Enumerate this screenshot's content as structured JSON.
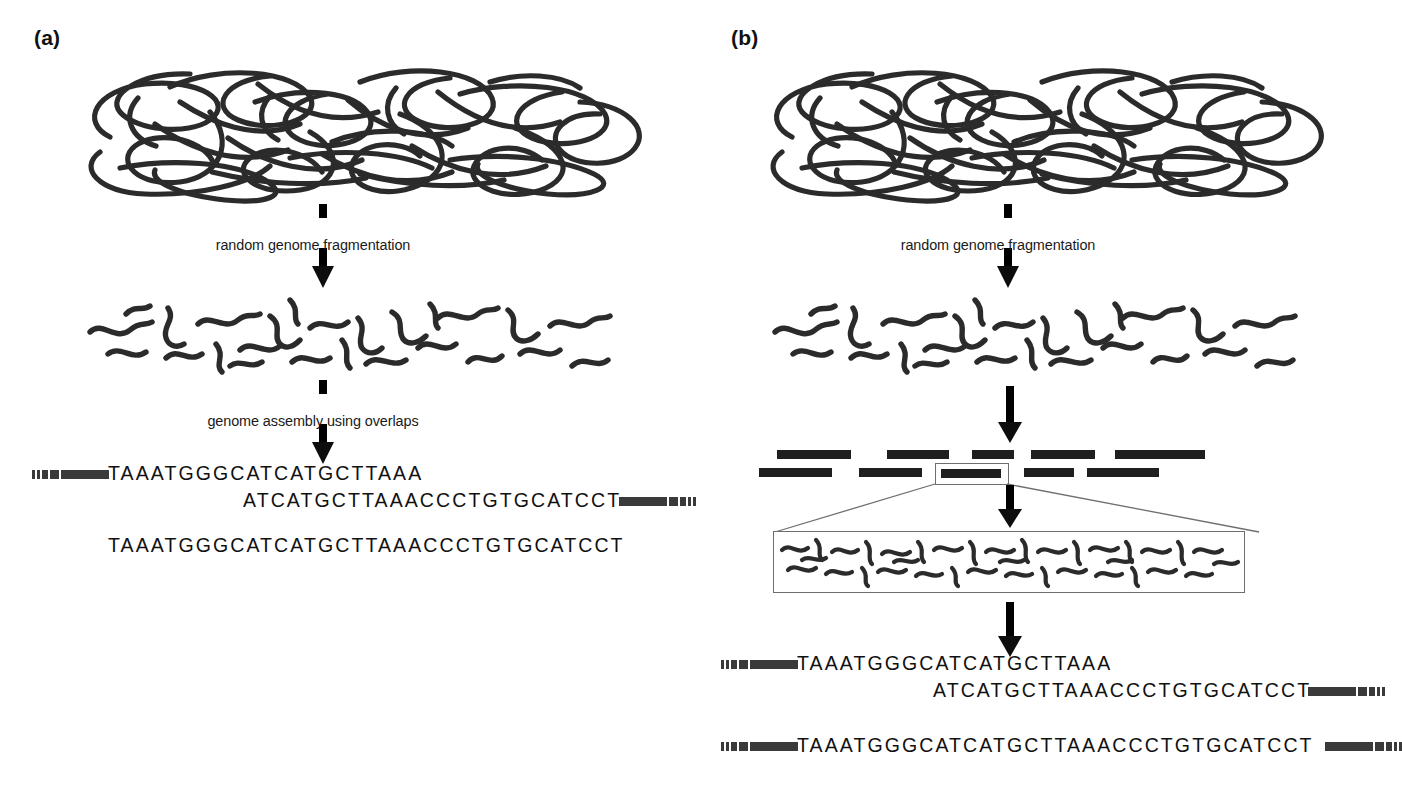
{
  "figure": {
    "type": "diagram",
    "background_color": "#ffffff",
    "ink_color": "#2b2b2b"
  },
  "panels": [
    {
      "id": "a",
      "label": "(a)",
      "steps": [
        {
          "name": "genome",
          "kind": "tangle",
          "caption": ""
        },
        {
          "name": "fragmentation-arrow",
          "kind": "split-arrow",
          "caption": "random genome fragmentation"
        },
        {
          "name": "fragments",
          "kind": "fragment-field",
          "caption": ""
        },
        {
          "name": "assembly-arrow",
          "kind": "split-arrow",
          "caption": "genome assembly using overlaps"
        },
        {
          "name": "reads",
          "kind": "sequences",
          "caption": ""
        }
      ],
      "reads": [
        {
          "text": "TAAATGGGCATCATGCTTAAA",
          "lead_ticks": true,
          "trail_ticks": false
        },
        {
          "text": "ATCATGCTTAAACCCTGTGCATCCT",
          "lead_ticks": false,
          "trail_ticks": true
        }
      ],
      "consensus": {
        "text": "TAAATGGGCATCATGCTTAAACCCTGTGCATCCT",
        "lead_ticks": false,
        "trail_ticks": false
      }
    },
    {
      "id": "b",
      "label": "(b)",
      "steps": [
        {
          "name": "genome",
          "kind": "tangle",
          "caption": ""
        },
        {
          "name": "fragmentation-arrow",
          "kind": "split-arrow",
          "caption": "random genome fragmentation"
        },
        {
          "name": "fragments",
          "kind": "fragment-field",
          "caption": ""
        },
        {
          "name": "clone-map-arrow",
          "kind": "solid-arrow",
          "caption": ""
        },
        {
          "name": "clone-contig-map",
          "kind": "contig-tiles",
          "caption": ""
        },
        {
          "name": "subclone-arrow",
          "kind": "solid-arrow",
          "caption": ""
        },
        {
          "name": "subclone-shearing",
          "kind": "inset-fragments",
          "caption": ""
        },
        {
          "name": "assembly-arrow",
          "kind": "solid-arrow",
          "caption": ""
        },
        {
          "name": "reads",
          "kind": "sequences",
          "caption": ""
        }
      ],
      "contig_rows": [
        [
          {
            "x": 18,
            "width": 74
          },
          {
            "x": 128,
            "width": 62
          },
          {
            "x": 213,
            "width": 42
          },
          {
            "x": 272,
            "width": 64
          },
          {
            "x": 356,
            "width": 90
          }
        ],
        [
          {
            "x": 0,
            "width": 73
          },
          {
            "x": 100,
            "width": 63
          },
          {
            "x": 178,
            "width": 68,
            "highlighted": true
          },
          {
            "x": 265,
            "width": 50
          },
          {
            "x": 328,
            "width": 72
          }
        ]
      ],
      "reads": [
        {
          "text": "TAAATGGGCATCATGCTTAAA",
          "lead_ticks": true,
          "trail_ticks": false
        },
        {
          "text": "ATCATGCTTAAACCCTGTGCATCCT",
          "lead_ticks": false,
          "trail_ticks": true
        }
      ],
      "consensus": {
        "text": "TAAATGGGCATCATGCTTAAACCCTGTGCATCCT",
        "lead_ticks": true,
        "trail_ticks": true
      }
    }
  ]
}
